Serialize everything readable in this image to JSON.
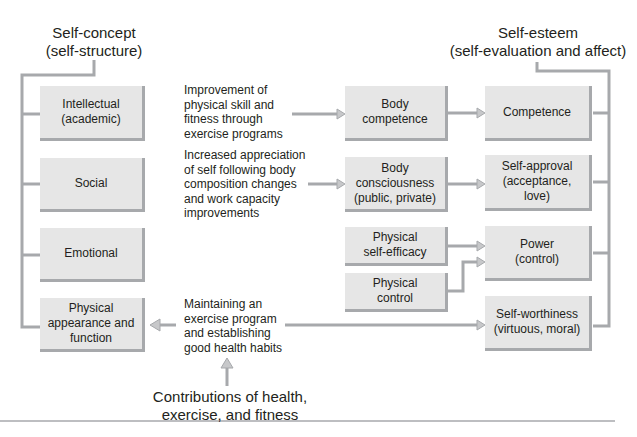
{
  "headings": {
    "self_concept": [
      "Self-concept",
      "(self-structure)"
    ],
    "self_esteem": [
      "Self-esteem",
      "(self-evaluation and affect)"
    ],
    "contributions": [
      "Contributions of health,",
      "exercise, and fitness"
    ]
  },
  "self_concept_domains": [
    {
      "id": "intellectual",
      "lines": [
        "Intellectual",
        "(academic)"
      ]
    },
    {
      "id": "social",
      "lines": [
        "Social"
      ]
    },
    {
      "id": "emotional",
      "lines": [
        "Emotional"
      ]
    },
    {
      "id": "physical",
      "lines": [
        "Physical",
        "appearance and",
        "function"
      ]
    }
  ],
  "contribution_notes": [
    {
      "id": "skill",
      "lines": [
        "Improvement of",
        "physical skill and",
        "fitness through",
        "exercise programs"
      ]
    },
    {
      "id": "appreciation",
      "lines": [
        "Increased appreciation",
        "of self following body",
        "composition changes",
        "and work capacity",
        "improvements"
      ]
    },
    {
      "id": "maintaining",
      "lines": [
        "Maintaining an",
        "exercise program",
        "and establishing",
        "good health habits"
      ]
    }
  ],
  "physical_self": [
    {
      "id": "body-competence",
      "lines": [
        "Body",
        "competence"
      ]
    },
    {
      "id": "body-consciousness",
      "lines": [
        "Body",
        "consciousness",
        "(public, private)"
      ]
    },
    {
      "id": "physical-self-efficacy",
      "lines": [
        "Physical",
        "self-efficacy"
      ]
    },
    {
      "id": "physical-control",
      "lines": [
        "Physical",
        "control"
      ]
    }
  ],
  "self_esteem_components": [
    {
      "id": "competence",
      "lines": [
        "Competence"
      ]
    },
    {
      "id": "self-approval",
      "lines": [
        "Self-approval",
        "(acceptance,",
        "love)"
      ]
    },
    {
      "id": "power",
      "lines": [
        "Power",
        "(control)"
      ]
    },
    {
      "id": "self-worthiness",
      "lines": [
        "Self-worthiness",
        "(virtuous, moral)"
      ]
    }
  ],
  "colors": {
    "box_fill": "#e6e6e6",
    "connector": "#a7a9ac",
    "text": "#231f20"
  }
}
